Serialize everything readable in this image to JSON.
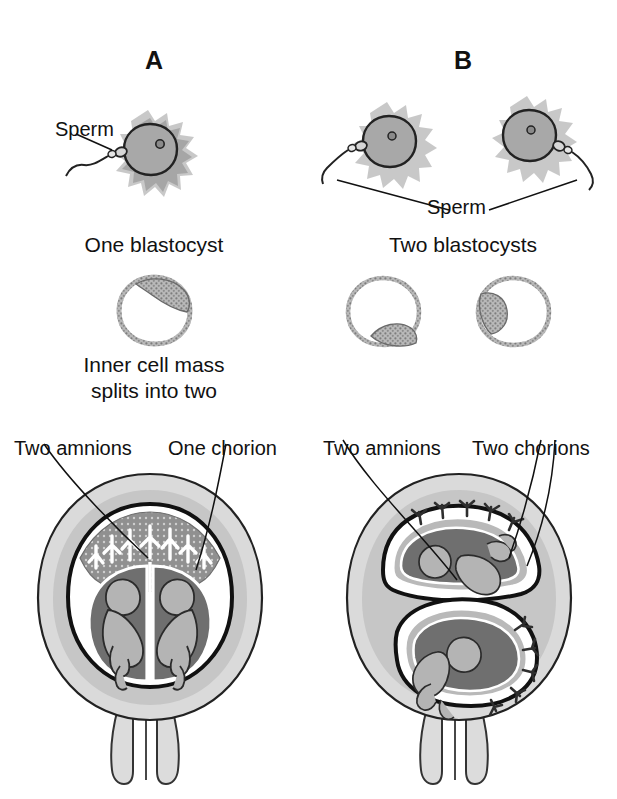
{
  "figure": {
    "type": "twinning-comparison-diagram"
  },
  "panels": [
    {
      "id": "A",
      "letter": "A",
      "fertilization": {
        "ova_count": 1,
        "sperm_count": 1,
        "sperm_label": "Sperm"
      },
      "blastocyst_caption": "One blastocyst",
      "blastocyst_count": 1,
      "split_caption_line1": "Inner cell mass",
      "split_caption_line2": "splits into two",
      "membrane_labels": {
        "left": "Two amnions",
        "right": "One chorion"
      },
      "uterus": {
        "fetus_count": 2,
        "placenta_count": 1,
        "arrangement": "side-by-side in one shared chorionic sac"
      }
    },
    {
      "id": "B",
      "letter": "B",
      "fertilization": {
        "ova_count": 2,
        "sperm_count": 2,
        "sperm_label": "Sperm"
      },
      "blastocyst_caption": "Two blastocysts",
      "blastocyst_count": 2,
      "membrane_labels": {
        "left": "Two amnions",
        "right": "Two chorions"
      },
      "uterus": {
        "fetus_count": 2,
        "placenta_count": 2,
        "arrangement": "two separate sacs stacked diagonally"
      }
    }
  ],
  "colors": {
    "ink": "#111111",
    "ovum_fill": "#a8a8a8",
    "corona": "#9a9a9a",
    "uterus_outer": "#d8d8d8",
    "uterus_mid": "#c4c4c4",
    "amniotic_cavity": "#6f6f6f",
    "placenta_band": "#8c8c8c",
    "fetus_fill": "#b4b4b4",
    "membrane_white": "#ffffff",
    "chorion_black": "#111111"
  }
}
